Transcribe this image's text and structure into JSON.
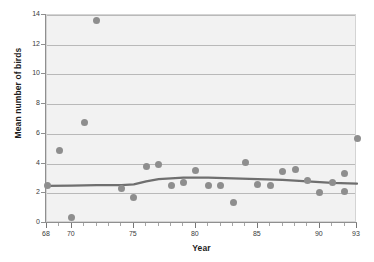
{
  "chart_data": {
    "type": "scatter",
    "title": "",
    "xlabel": "Year",
    "ylabel": "Mean number of birds",
    "xlim": [
      68,
      93
    ],
    "ylim": [
      0,
      14
    ],
    "grid": true,
    "legend": null,
    "xtick_labels": [
      "68",
      "70",
      "75",
      "80",
      "85",
      "90",
      "93"
    ],
    "xtick_values": [
      68,
      70,
      75,
      80,
      85,
      90,
      93
    ],
    "xminor_step": 1,
    "ytick_labels": [
      "0",
      "2",
      "4",
      "6",
      "8",
      "10",
      "12",
      "14"
    ],
    "ytick_values": [
      0,
      2,
      4,
      6,
      8,
      10,
      12,
      14
    ],
    "marker_color": "#8e8e8e",
    "trendline_color": "#6f6f6f",
    "plot_background": "#f2f2f2",
    "points": [
      {
        "x": 68,
        "y": 2.5
      },
      {
        "x": 69,
        "y": 4.85
      },
      {
        "x": 70,
        "y": 0.4
      },
      {
        "x": 71,
        "y": 6.75
      },
      {
        "x": 72,
        "y": 13.6
      },
      {
        "x": 74,
        "y": 2.3
      },
      {
        "x": 75,
        "y": 1.7
      },
      {
        "x": 76,
        "y": 3.8
      },
      {
        "x": 77,
        "y": 3.95
      },
      {
        "x": 78,
        "y": 2.5
      },
      {
        "x": 79,
        "y": 2.75
      },
      {
        "x": 80,
        "y": 3.55
      },
      {
        "x": 81,
        "y": 2.5
      },
      {
        "x": 82,
        "y": 2.5
      },
      {
        "x": 83,
        "y": 1.4
      },
      {
        "x": 84,
        "y": 4.05
      },
      {
        "x": 85,
        "y": 2.6
      },
      {
        "x": 86,
        "y": 2.55
      },
      {
        "x": 87,
        "y": 3.45
      },
      {
        "x": 88,
        "y": 3.6
      },
      {
        "x": 89,
        "y": 2.85
      },
      {
        "x": 90,
        "y": 2.05
      },
      {
        "x": 91,
        "y": 2.75
      },
      {
        "x": 92,
        "y": 3.3
      },
      {
        "x": 92,
        "y": 2.1
      },
      {
        "x": 93,
        "y": 5.7
      }
    ],
    "trendline": [
      {
        "x": 68,
        "y": 2.5
      },
      {
        "x": 70,
        "y": 2.52
      },
      {
        "x": 72,
        "y": 2.55
      },
      {
        "x": 74,
        "y": 2.55
      },
      {
        "x": 75,
        "y": 2.6
      },
      {
        "x": 76,
        "y": 2.8
      },
      {
        "x": 77,
        "y": 2.95
      },
      {
        "x": 79,
        "y": 3.05
      },
      {
        "x": 81,
        "y": 3.05
      },
      {
        "x": 83,
        "y": 3.0
      },
      {
        "x": 85,
        "y": 2.95
      },
      {
        "x": 87,
        "y": 2.9
      },
      {
        "x": 89,
        "y": 2.8
      },
      {
        "x": 91,
        "y": 2.7
      },
      {
        "x": 93,
        "y": 2.65
      }
    ]
  }
}
